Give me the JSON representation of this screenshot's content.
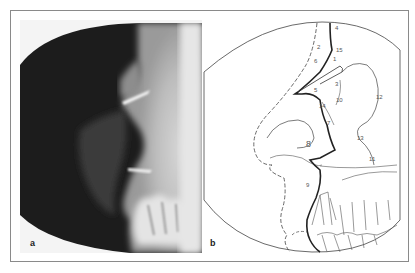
{
  "figure": {
    "panels": [
      {
        "id": "a",
        "label": "a",
        "type": "radiograph",
        "description": "Lateral radiograph of soft-tissue facial profile"
      },
      {
        "id": "b",
        "label": "b",
        "type": "tracing",
        "description": "Line tracing of the radiograph with numbered landmarks",
        "landmarks": [
          "1",
          "2",
          "3",
          "4",
          "5",
          "6",
          "7",
          "8",
          "9",
          "10",
          "11",
          "12",
          "13",
          "14",
          "15"
        ]
      }
    ],
    "colors": {
      "frame_border": "#8a8a8a",
      "xray_dark": "#1a1a1a",
      "xray_light": "#e8e8e8",
      "line": "#333333"
    }
  },
  "labels": {
    "l1": "1",
    "l2": "2",
    "l3": "3",
    "l4": "4",
    "l5": "5",
    "l6": "6",
    "l7": "7",
    "l8": "8",
    "l9": "9",
    "l10": "10",
    "l11": "11",
    "l12": "12",
    "l13": "13",
    "l14": "14",
    "l15": "15"
  }
}
